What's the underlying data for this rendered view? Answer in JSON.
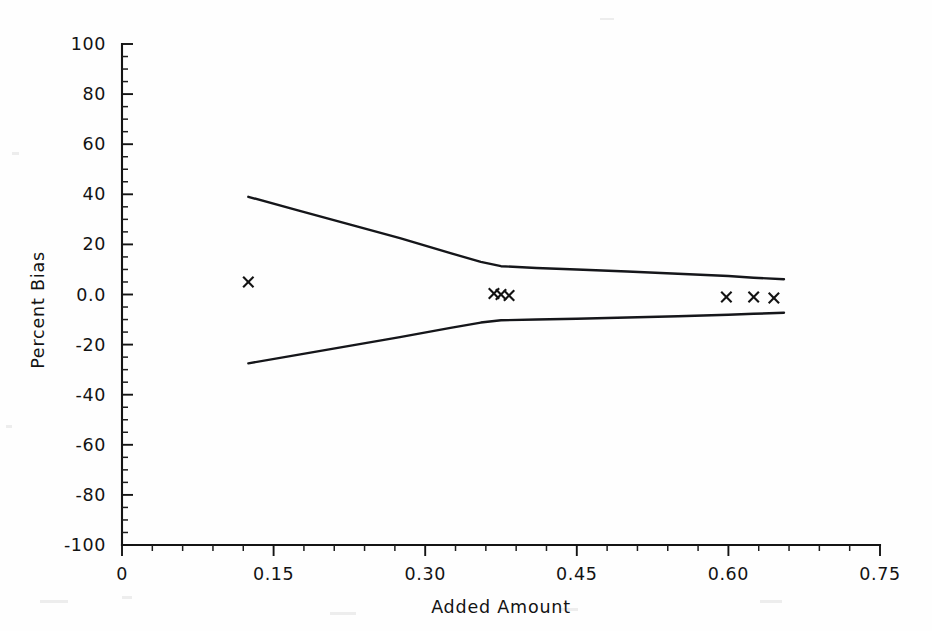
{
  "figure": {
    "background_color": "#fefefe",
    "ink_color": "#141414"
  },
  "chart_data": {
    "type": "line",
    "title": "",
    "xlabel": "Added Amount",
    "ylabel": "Percent Bias",
    "xlim": [
      0,
      0.75
    ],
    "ylim": [
      -100,
      100
    ],
    "grid": false,
    "legend": "none",
    "x_ticks": [
      {
        "value": 0,
        "label": "0"
      },
      {
        "value": 0.15,
        "label": "0.15"
      },
      {
        "value": 0.3,
        "label": "0.30"
      },
      {
        "value": 0.45,
        "label": "0.45"
      },
      {
        "value": 0.6,
        "label": "0.60"
      },
      {
        "value": 0.75,
        "label": "0.75"
      }
    ],
    "x_minor_per_major": 5,
    "y_ticks": [
      {
        "value": 100,
        "label": "100"
      },
      {
        "value": 80,
        "label": "80"
      },
      {
        "value": 60,
        "label": "60"
      },
      {
        "value": 40,
        "label": "40"
      },
      {
        "value": 20,
        "label": "20"
      },
      {
        "value": 0,
        "label": "0.0"
      },
      {
        "value": -20,
        "label": "-20"
      },
      {
        "value": -40,
        "label": "-40"
      },
      {
        "value": -60,
        "label": "-60"
      },
      {
        "value": -80,
        "label": "-80"
      },
      {
        "value": -100,
        "label": "-100"
      }
    ],
    "y_minor_per_major": 4,
    "series": [
      {
        "name": "upper-limit-curve",
        "style": "solid-line",
        "x": [
          0.125,
          0.175,
          0.225,
          0.275,
          0.325,
          0.355,
          0.375,
          0.41,
          0.45,
          0.5,
          0.55,
          0.6,
          0.625,
          0.655
        ],
        "y": [
          39.0,
          33.5,
          28.0,
          22.5,
          16.5,
          13.0,
          11.3,
          10.6,
          10.0,
          9.2,
          8.3,
          7.4,
          6.7,
          6.1
        ]
      },
      {
        "name": "lower-limit-curve",
        "style": "solid-line",
        "x": [
          0.125,
          0.175,
          0.225,
          0.275,
          0.325,
          0.355,
          0.375,
          0.41,
          0.45,
          0.5,
          0.55,
          0.6,
          0.625,
          0.655
        ],
        "y": [
          -27.5,
          -24.0,
          -20.5,
          -17.0,
          -13.3,
          -11.2,
          -10.3,
          -10.0,
          -9.7,
          -9.2,
          -8.7,
          -8.1,
          -7.7,
          -7.3
        ]
      },
      {
        "name": "observed-bias-points",
        "style": "x-markers",
        "points": [
          {
            "x": 0.125,
            "y": 5.0
          },
          {
            "x": 0.368,
            "y": 0.4
          },
          {
            "x": 0.375,
            "y": 0.0
          },
          {
            "x": 0.383,
            "y": -0.4
          },
          {
            "x": 0.598,
            "y": -1.0
          },
          {
            "x": 0.625,
            "y": -1.0
          },
          {
            "x": 0.645,
            "y": -1.4
          }
        ]
      }
    ]
  }
}
